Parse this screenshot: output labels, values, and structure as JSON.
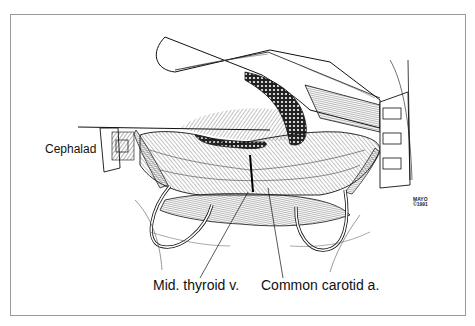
{
  "figure": {
    "labels": {
      "orientation": "Cephalad",
      "vein": "Mid. thyroid v.",
      "artery": "Common carotid a."
    },
    "signature": {
      "line1": "MAYO",
      "line2": "©1991"
    },
    "colors": {
      "ink": "#111111",
      "frame": "#9a9a9a",
      "background": "#ffffff"
    }
  }
}
